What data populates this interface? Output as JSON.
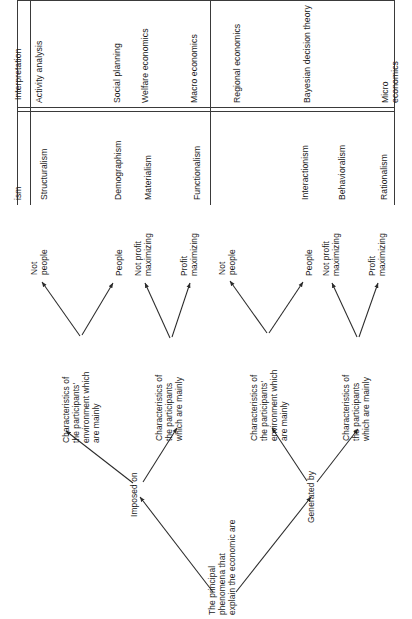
{
  "table": {
    "row_labels": [
      "Interpretation",
      "ism"
    ],
    "groups": [
      {
        "name": "left-group",
        "interpretation": [
          "Activity analysis",
          "Social planning",
          "Welfare economics",
          "Macro economics"
        ],
        "ism": [
          "Structuralism",
          "Demographism",
          "Materialism",
          "Functionalism"
        ]
      },
      {
        "name": "right-group",
        "interpretation": [
          "Regional economics",
          "Bayesian decision theory",
          "Micro economics"
        ],
        "ism": [
          "Interactionism",
          "Behavioralism",
          "Rationalism"
        ]
      }
    ],
    "header_cells": {
      "c1": "Activity analysis",
      "c2": "Social planning",
      "c3": "Welfare economics",
      "c4": "Macro economics",
      "c5": "Regional economics",
      "c6": "Bayesian decision theory",
      "c7": "Micro economics",
      "i1": "Structuralism",
      "i2": "Demographism",
      "i3": "Materialism",
      "i4": "Functionalism",
      "i5": "Interactionism",
      "i6": "Behavioralism",
      "i7": "Rationalism"
    }
  },
  "tree": {
    "root": "The principal\nphenomena that\nexplain the economic are",
    "edge_labels": {
      "left": "Imposed on",
      "right": "Generated by"
    },
    "branches": {
      "b1": {
        "node": "Characteristics of\nthe participants'\nenvironment which\nare mainly",
        "leaf_a": "Not\npeople",
        "leaf_b": "People"
      },
      "b2": {
        "node": "Characteristics of\nthe participants\nwhich are mainly",
        "leaf_a": "Not profit\nmaximizing",
        "leaf_b": "Profit\nmaximizing"
      },
      "b3": {
        "node": "Characteristics of\nthe participants'\nenvironment which\nare mainly",
        "leaf_a": "Not\npeople",
        "leaf_b": "People"
      },
      "b4": {
        "node": "Characteristics of\nthe participants\nwhich are mainly",
        "leaf_a": "Not profit\nmaximizing",
        "leaf_b": "Profit\nmaximizing"
      }
    }
  },
  "colors": {
    "ink": "#1a1a1a",
    "rule": "#3a3a3a",
    "edge": "#2b2b2b",
    "background": "#ffffff"
  }
}
